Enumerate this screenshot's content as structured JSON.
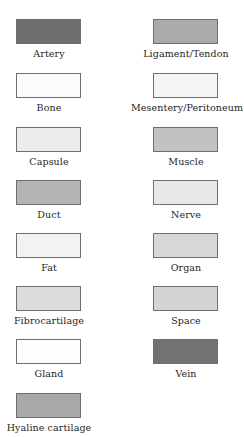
{
  "legend": {
    "left": [
      {
        "label": "Artery",
        "color": "#6f6f6f"
      },
      {
        "label": "Bone",
        "color": "#fbfbfb"
      },
      {
        "label": "Capsule",
        "color": "#ececec"
      },
      {
        "label": "Duct",
        "color": "#b4b4b4"
      },
      {
        "label": "Fat",
        "color": "#f2f2f2"
      },
      {
        "label": "Fibrocartilage",
        "color": "#dcdcdc"
      },
      {
        "label": "Gland",
        "color": "#fdfdfd"
      },
      {
        "label": "Hyaline cartilage",
        "color": "#a8a8a8"
      }
    ],
    "right": [
      {
        "label": "Ligament/Tendon",
        "color": "#ababab"
      },
      {
        "label": "Mesentery/Peritoneum",
        "color": "#f4f4f4"
      },
      {
        "label": "Muscle",
        "color": "#c2c2c2"
      },
      {
        "label": "Nerve",
        "color": "#e8e8e8"
      },
      {
        "label": "Organ",
        "color": "#d8d8d8"
      },
      {
        "label": "Space",
        "color": "#d4d4d4"
      },
      {
        "label": "Vein",
        "color": "#727272"
      }
    ]
  }
}
